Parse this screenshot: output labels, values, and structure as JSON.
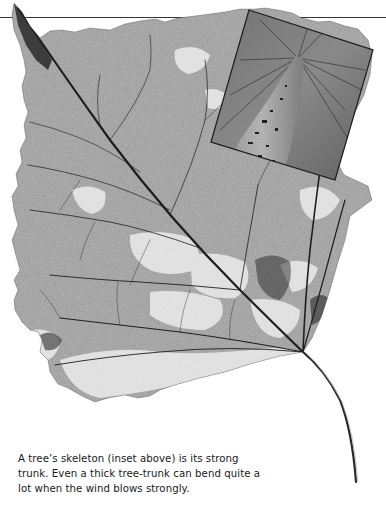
{
  "page": {
    "background": "#ffffff",
    "rule_color": "#333333"
  },
  "figure": {
    "main_image": "skeleton-leaf",
    "inset_image": "tree-trunk-looking-up",
    "leaf_color": "#8c8c8c",
    "vein_color": "#1e1e1e"
  },
  "caption": {
    "lines": [
      "A tree’s skeleton (inset above) is its strong",
      "trunk. Even a thick tree-trunk can bend quite a",
      "lot when the wind blows strongly."
    ]
  }
}
